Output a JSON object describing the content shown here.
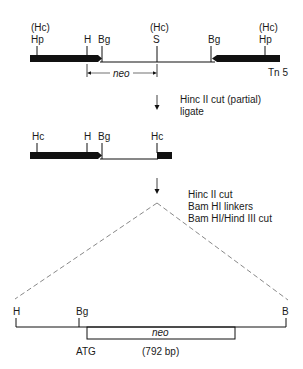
{
  "top_construct": {
    "labels": {
      "hc_left": "(Hc)",
      "hp_left": "Hp",
      "h": "H",
      "bg_left": "Bg",
      "hc_mid": "(Hc)",
      "s": "S",
      "bg_right": "Bg",
      "hc_right": "(Hc)",
      "hp_right": "Hp"
    },
    "neo_label": "neo",
    "transposon_label": "Tn 5"
  },
  "step1": {
    "line1": "Hinc II cut (partial)",
    "line2": "ligate"
  },
  "middle_construct": {
    "labels": {
      "hc_left": "Hc",
      "h": "H",
      "bg": "Bg",
      "hc_right": "Hc"
    }
  },
  "step2": {
    "line1": "Hinc II cut",
    "line2": "Bam HI linkers",
    "line3": "Bam HI/Hind III cut"
  },
  "bottom_construct": {
    "labels": {
      "h": "H",
      "bg": "Bg",
      "b": "B"
    },
    "neo_label": "neo",
    "start_codon": "ATG",
    "length": "(792 bp)"
  },
  "colors": {
    "ink": "#1a1a1a",
    "dashed": "#555555"
  }
}
